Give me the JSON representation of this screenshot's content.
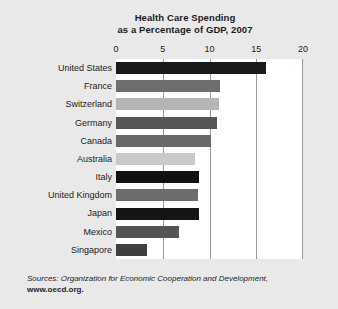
{
  "chart_data": {
    "type": "bar",
    "orientation": "horizontal",
    "title": "Health Care Spending as a Percentage of GDP, 2007",
    "title_line1": "Health Care Spending",
    "title_line2": "as a Percentage of GDP, 2007",
    "xlabel": "",
    "ylabel": "",
    "xlim": [
      0,
      20
    ],
    "xticks": [
      0,
      5,
      10,
      15,
      20
    ],
    "xtick_labels": [
      "0",
      "5",
      "10",
      "15",
      "20"
    ],
    "grid": "vertical",
    "legend": "none",
    "categories": [
      "United States",
      "France",
      "Switzerland",
      "Germany",
      "Canada",
      "Australia",
      "Italy",
      "United Kingdom",
      "Japan",
      "Mexico",
      "Singapore"
    ],
    "values": [
      16.0,
      11.1,
      11.0,
      10.8,
      10.2,
      8.5,
      8.9,
      8.8,
      8.9,
      6.7,
      3.3
    ],
    "bar_colors": [
      "#1a1a1a",
      "#6e6e6e",
      "#b5b5b5",
      "#565656",
      "#686868",
      "#c9c9c9",
      "#111111",
      "#6d6d6d",
      "#141414",
      "#545454",
      "#3f3f3f"
    ],
    "bars": [
      {
        "label": "United States",
        "value": 16.0,
        "color": "#1a1a1a"
      },
      {
        "label": "France",
        "value": 11.1,
        "color": "#6e6e6e"
      },
      {
        "label": "Switzerland",
        "value": 11.0,
        "color": "#b5b5b5"
      },
      {
        "label": "Germany",
        "value": 10.8,
        "color": "#565656"
      },
      {
        "label": "Canada",
        "value": 10.2,
        "color": "#686868"
      },
      {
        "label": "Australia",
        "value": 8.5,
        "color": "#c9c9c9"
      },
      {
        "label": "Italy",
        "value": 8.9,
        "color": "#111111"
      },
      {
        "label": "United Kingdom",
        "value": 8.8,
        "color": "#6d6d6d"
      },
      {
        "label": "Japan",
        "value": 8.9,
        "color": "#141414"
      },
      {
        "label": "Mexico",
        "value": 6.7,
        "color": "#545454"
      },
      {
        "label": "Singapore",
        "value": 3.3,
        "color": "#3f3f3f"
      }
    ]
  },
  "source": {
    "prefix": "Sources:",
    "text": "Organization for Economic Cooperation and Development,",
    "url": "www.oecd.org."
  },
  "colors": {
    "background": "#e9e9e9",
    "plot_background": "#ffffff",
    "gridline": "#9a9a9a",
    "text": "#1b1b1b"
  }
}
